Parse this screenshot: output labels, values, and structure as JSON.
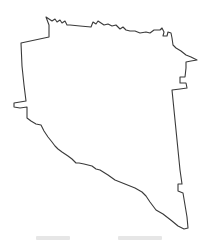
{
  "map": {
    "kind": "administrative-boundary-outline",
    "stroke_color": "#3a3a3a",
    "fill_color": "#ffffff",
    "background_color": "#ffffff",
    "outline_points": "46,17 49,19 52,21 55,19 57,22 60,20 62,23 65,21 67,25 70,25 80,26 91,27 93,22 96,24 98,21 101,23 104,25 108,24 112,26 116,25 120,29 123,27 126,30 130,31 135,31 140,33 146,32 150,33 154,30 160,30 162,28 164,32 163,36 167,36 168,32 171,33 172,38 173,45 176,48 181,51 186,55 191,57 197,60 191,61 186,62 186,68 185,77 180,77 180,83 186,83 187,88 180,89 172,90 174,110 176,130 178,150 180,170 182,184 178,184 178,191 183,193 185,205 187,217 188,228 184,229 178,226 172,221 163,214 156,210 150,202 146,196 142,192 135,188 125,184 115,180 108,175 100,170 96,169 92,166 88,165 84,164 79,163 76,163 72,159 68,156 62,152 58,149 55,146 52,142 48,137 44,131 41,125 36,124 31,121 27,118 27,107 20,108 14,107 14,103 20,102 26,101 24,85 22,66 21,43 49,37 49,25 46,17",
    "note_lower_caption": "cropped, illegible"
  }
}
